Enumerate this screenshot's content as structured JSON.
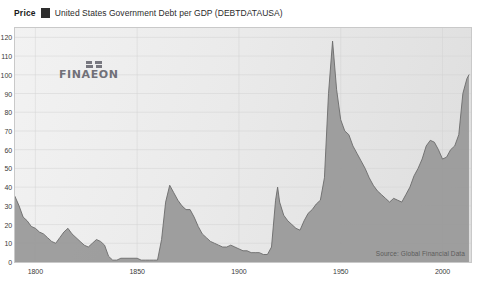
{
  "legend": {
    "price_label": "Price",
    "swatch_color": "#2e2e2e",
    "series_label": "United States Government Debt per GDP (DEBTDATAUSA)"
  },
  "watermark": {
    "text": "FINAEON",
    "mark_name": "finaeon-squares-logo"
  },
  "source_note": "Source: Global Financial Data",
  "colors": {
    "area_fill": "#9a9a9a",
    "area_line": "#6e6e6e",
    "plot_background": "#ececec",
    "grid": "#d2d2d2",
    "frame_border": "#c9c9c9",
    "text": "#3a3a3a"
  },
  "chart_data": {
    "type": "area",
    "title": "United States Government Debt per GDP (DEBTDATAUSA)",
    "subtitle": "Price",
    "xlabel": "",
    "ylabel": "",
    "xlim": [
      1790,
      2014
    ],
    "ylim": [
      0,
      125
    ],
    "grid": true,
    "legend_position": "top-left",
    "xticks": [
      1800,
      1850,
      1900,
      1950,
      2000
    ],
    "yticks": [
      0,
      10,
      20,
      30,
      40,
      50,
      60,
      70,
      80,
      90,
      100,
      110,
      120
    ],
    "ytick_labels": [
      "0",
      "10",
      "20",
      "30",
      "40",
      "50",
      "60",
      "70",
      "80",
      "90",
      "100",
      "110",
      "120"
    ],
    "xtick_labels": [
      "1800",
      "1850",
      "1900",
      "1950",
      "2000"
    ],
    "series": [
      {
        "name": "United States Government Debt per GDP",
        "x": [
          1790,
          1792,
          1794,
          1796,
          1798,
          1800,
          1802,
          1804,
          1806,
          1808,
          1810,
          1812,
          1814,
          1816,
          1818,
          1820,
          1822,
          1824,
          1826,
          1828,
          1830,
          1832,
          1834,
          1836,
          1838,
          1840,
          1842,
          1844,
          1846,
          1848,
          1850,
          1852,
          1854,
          1856,
          1858,
          1860,
          1862,
          1864,
          1866,
          1868,
          1870,
          1872,
          1874,
          1876,
          1878,
          1880,
          1882,
          1884,
          1886,
          1888,
          1890,
          1892,
          1894,
          1896,
          1898,
          1900,
          1902,
          1904,
          1906,
          1908,
          1910,
          1912,
          1914,
          1916,
          1918,
          1919,
          1920,
          1922,
          1924,
          1926,
          1928,
          1930,
          1932,
          1934,
          1936,
          1938,
          1940,
          1942,
          1944,
          1946,
          1948,
          1950,
          1952,
          1954,
          1956,
          1958,
          1960,
          1962,
          1964,
          1966,
          1968,
          1970,
          1972,
          1974,
          1976,
          1978,
          1980,
          1982,
          1984,
          1986,
          1988,
          1990,
          1992,
          1994,
          1996,
          1998,
          2000,
          2002,
          2004,
          2006,
          2008,
          2010,
          2012,
          2013
        ],
        "y": [
          35,
          30,
          24,
          22,
          19,
          18,
          16,
          15,
          13,
          11,
          10,
          13,
          16,
          18,
          15,
          13,
          11,
          9,
          8,
          10,
          12,
          11,
          9,
          3,
          1,
          1,
          2,
          2,
          2,
          2,
          2,
          1,
          1,
          1,
          1,
          1,
          12,
          32,
          41,
          37,
          33,
          30,
          28,
          28,
          24,
          19,
          15,
          13,
          11,
          10,
          9,
          8,
          8,
          9,
          8,
          7,
          6,
          6,
          5,
          5,
          5,
          4,
          4,
          8,
          33,
          40,
          32,
          25,
          22,
          20,
          18,
          17,
          22,
          26,
          28,
          31,
          33,
          45,
          90,
          118,
          92,
          76,
          70,
          68,
          62,
          58,
          54,
          50,
          45,
          41,
          38,
          36,
          34,
          32,
          34,
          33,
          32,
          36,
          40,
          46,
          50,
          55,
          62,
          65,
          64,
          60,
          55,
          56,
          60,
          62,
          68,
          90,
          98,
          100
        ]
      }
    ]
  }
}
